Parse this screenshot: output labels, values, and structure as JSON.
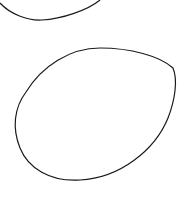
{
  "canvas": {
    "width": 182,
    "height": 200,
    "background": "#ffffff",
    "stroke_color": "#1a1a1a"
  },
  "shapes": [
    {
      "name": "top-partial-oval",
      "type": "curve"
    },
    {
      "name": "egg-shape",
      "type": "closed-oval"
    }
  ]
}
